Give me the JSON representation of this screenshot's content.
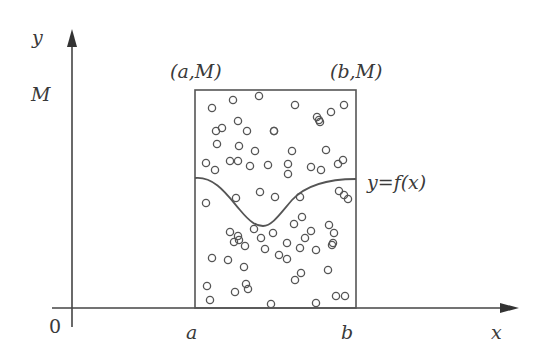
{
  "diagram": {
    "axes": {
      "x_label": "x",
      "y_label": "y",
      "origin_label": "0",
      "y_tick_label": "M",
      "x_tick_a": "a",
      "x_tick_b": "b"
    },
    "corner_labels": {
      "top_left": "(a,M)",
      "top_right": "(b,M)"
    },
    "curve_label": "y=f(x)",
    "colors": {
      "line": "#444444",
      "background": "#ffffff"
    },
    "points": [
      [
        212,
        108
      ],
      [
        233,
        100
      ],
      [
        259,
        96
      ],
      [
        295,
        105
      ],
      [
        317,
        117
      ],
      [
        320,
        122
      ],
      [
        331,
        112
      ],
      [
        344,
        105
      ],
      [
        216,
        131
      ],
      [
        222,
        128
      ],
      [
        238,
        121
      ],
      [
        247,
        131
      ],
      [
        274,
        131
      ],
      [
        274,
        131
      ],
      [
        319,
        120
      ],
      [
        217,
        144
      ],
      [
        239,
        146
      ],
      [
        255,
        151
      ],
      [
        292,
        151
      ],
      [
        326,
        150
      ],
      [
        206,
        163
      ],
      [
        230,
        161
      ],
      [
        250,
        166
      ],
      [
        268,
        165
      ],
      [
        288,
        164
      ],
      [
        311,
        167
      ],
      [
        338,
        164
      ],
      [
        343,
        160
      ],
      [
        215,
        170
      ],
      [
        238,
        161
      ],
      [
        288,
        174
      ],
      [
        321,
        170
      ],
      [
        206,
        203
      ],
      [
        236,
        198
      ],
      [
        260,
        192
      ],
      [
        275,
        197
      ],
      [
        300,
        197
      ],
      [
        339,
        191
      ],
      [
        344,
        195
      ],
      [
        230,
        232
      ],
      [
        238,
        236
      ],
      [
        254,
        229
      ],
      [
        273,
        233
      ],
      [
        294,
        224
      ],
      [
        302,
        217
      ],
      [
        305,
        238
      ],
      [
        311,
        231
      ],
      [
        329,
        225
      ],
      [
        348,
        199
      ],
      [
        234,
        242
      ],
      [
        239,
        240
      ],
      [
        245,
        246
      ],
      [
        261,
        238
      ],
      [
        287,
        243
      ],
      [
        300,
        248
      ],
      [
        332,
        245
      ],
      [
        334,
        233
      ],
      [
        212,
        258
      ],
      [
        228,
        260
      ],
      [
        244,
        267
      ],
      [
        265,
        249
      ],
      [
        279,
        255
      ],
      [
        287,
        259
      ],
      [
        316,
        250
      ],
      [
        333,
        243
      ],
      [
        207,
        286
      ],
      [
        235,
        292
      ],
      [
        246,
        284
      ],
      [
        248,
        289
      ],
      [
        295,
        280
      ],
      [
        301,
        273
      ],
      [
        328,
        270
      ],
      [
        336,
        296
      ],
      [
        210,
        300
      ],
      [
        271,
        304
      ],
      [
        316,
        303
      ],
      [
        345,
        296
      ]
    ]
  }
}
